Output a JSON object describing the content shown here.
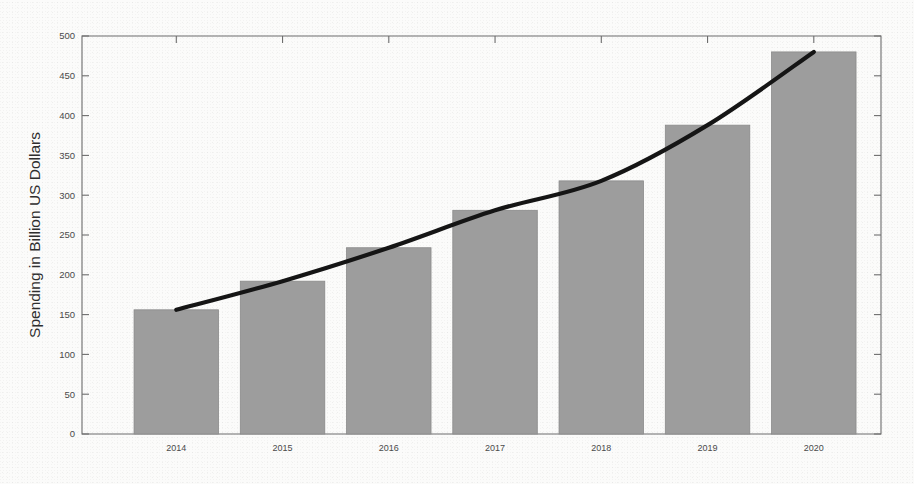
{
  "chart_data": {
    "type": "bar",
    "title": "",
    "subtitle": "",
    "xlabel": "",
    "ylabel": "Spending in Billion US Dollars",
    "categories": [
      "2014",
      "2015",
      "2016",
      "2017",
      "2018",
      "2019",
      "2020"
    ],
    "values": [
      156,
      192,
      234,
      281,
      318,
      388,
      480
    ],
    "series": [
      {
        "name": "Spending",
        "type": "bar",
        "values": [
          156,
          192,
          234,
          281,
          318,
          388,
          480
        ]
      },
      {
        "name": "Trend",
        "type": "line",
        "values": [
          156,
          192,
          234,
          281,
          318,
          388,
          480
        ]
      }
    ],
    "ylim": [
      0,
      500
    ],
    "yticks": [
      0,
      50,
      100,
      150,
      200,
      250,
      300,
      350,
      400,
      450,
      500
    ],
    "ytick_labels": [
      "0",
      "50",
      "100",
      "150",
      "200",
      "250",
      "300",
      "350",
      "400",
      "450",
      "500"
    ],
    "xtick_labels": [
      "2014",
      "2015",
      "2016",
      "2017",
      "2018",
      "2019",
      "2020"
    ],
    "grid": false,
    "legend": "none",
    "colors": {
      "bar_fill": "#9d9d9d",
      "bar_edge": "#8a8a8a",
      "line": "#151515",
      "axis": "#6d6d6d",
      "text": "#3a3a3a",
      "background": "#fbfbfa"
    }
  }
}
